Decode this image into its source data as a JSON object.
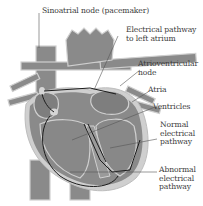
{
  "diagram": {
    "colors": {
      "tissue": "#8a8a8a",
      "tissue_dark": "#6e6e6e",
      "outline": "#c9c9c9",
      "pathway": "#1c1c1c",
      "text": "#3a3a3a",
      "background": "#ffffff"
    },
    "labels": [
      {
        "id": "sa-node",
        "text": "Sinoatrial node (pacemaker)"
      },
      {
        "id": "left-atrium-pathway",
        "lines": [
          "Electrical pathway",
          "to left atrium"
        ]
      },
      {
        "id": "av-node",
        "lines": [
          "Atrioventricular",
          "node"
        ]
      },
      {
        "id": "atria",
        "text": "Atria"
      },
      {
        "id": "ventricles",
        "text": "Ventricles"
      },
      {
        "id": "normal-pathway",
        "lines": [
          "Normal",
          "electrical",
          "pathway"
        ]
      },
      {
        "id": "abnormal-pathway",
        "lines": [
          "Abnormal",
          "electrical",
          "pathway"
        ]
      }
    ]
  }
}
